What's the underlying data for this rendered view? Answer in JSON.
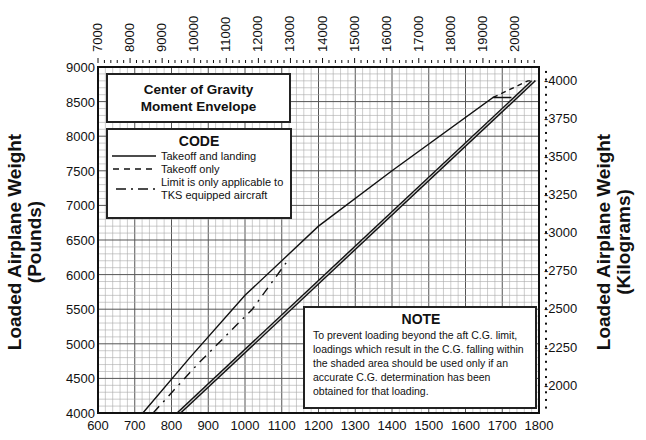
{
  "chart_data": {
    "type": "line",
    "title": "Center of Gravity Moment Envelope",
    "xlabel": "Loaded Airplane Moment/1000 (Pound-Inches)",
    "ylabel_left": "Loaded Airplane Weight (Pounds)",
    "ylabel_right": "Loaded Airplane Weight (Kilograms)",
    "xlim": [
      600,
      1800
    ],
    "ylim": [
      4000,
      9000
    ],
    "x_ticks": [
      600,
      700,
      800,
      900,
      1000,
      1100,
      1200,
      1300,
      1400,
      1500,
      1600,
      1700,
      1800
    ],
    "y_ticks": [
      4000,
      4500,
      5000,
      5500,
      6000,
      6500,
      7000,
      7500,
      8000,
      8500,
      9000
    ],
    "top_axis_ticks": [
      "7000",
      "8000",
      "9000",
      "10000",
      "11000",
      "12000",
      "13000",
      "14000",
      "15000",
      "16000",
      "17000",
      "18000",
      "19000",
      "20000"
    ],
    "right_axis_ticks": [
      "-4000",
      "-3750",
      "-3500",
      "-3250",
      "-3000",
      "-2750",
      "-2500",
      "-2250",
      "-2000"
    ],
    "grid": true,
    "series": [
      {
        "name": "Forward limit - Takeoff and landing",
        "style": "solid",
        "points": [
          [
            722,
            4000
          ],
          [
            850,
            4800
          ],
          [
            1000,
            5700
          ],
          [
            1200,
            6700
          ],
          [
            1400,
            7500
          ],
          [
            1675,
            8560
          ],
          [
            1725,
            8560
          ]
        ]
      },
      {
        "name": "Aft limit - Takeoff and landing (outer)",
        "style": "solid",
        "points": [
          [
            815,
            4000
          ],
          [
            1780,
            8800
          ]
        ]
      },
      {
        "name": "Aft limit - Takeoff and landing (inner, shaded band)",
        "style": "solid",
        "points": [
          [
            825,
            4000
          ],
          [
            1790,
            8800
          ]
        ]
      },
      {
        "name": "Takeoff only",
        "style": "dashed",
        "points": [
          [
            1675,
            8560
          ],
          [
            1770,
            8800
          ],
          [
            1790,
            8800
          ]
        ]
      },
      {
        "name": "Limit is only applicable to TKS equipped aircraft",
        "style": "dashdot",
        "points": [
          [
            750,
            4000
          ],
          [
            870,
            4700
          ],
          [
            1020,
            5500
          ],
          [
            1120,
            6230
          ]
        ]
      }
    ]
  },
  "title_box": {
    "line1": "Center of Gravity",
    "line2": "Moment Envelope"
  },
  "code_box": {
    "header": "CODE",
    "items": [
      {
        "style": "solid",
        "label": "Takeoff and landing"
      },
      {
        "style": "dashed",
        "label": "Takeoff only"
      },
      {
        "style": "dashdot",
        "label": "Limit is only applicable to TKS equipped aircraft"
      }
    ],
    "item0": "Takeoff and landing",
    "item1": "Takeoff only",
    "item2a": "Limit is only applicable to",
    "item2b": "TKS equipped aircraft"
  },
  "note_box": {
    "header": "NOTE",
    "text": "To prevent loading beyond the aft C.G. limit, loadings which result in the C.G. falling within the shaded area should be used only if an accurate C.G. determination has been obtained for that loading."
  },
  "labels": {
    "left_y_line1": "Loaded Airplane Weight",
    "left_y_line2": "(Pounds)",
    "right_y_line1": "Loaded Airplane Weight",
    "right_y_line2": "(Kilograms)"
  }
}
